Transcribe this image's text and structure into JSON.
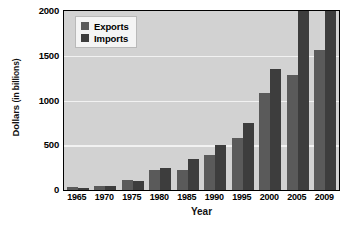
{
  "chart_data": {
    "type": "bar",
    "title": "",
    "xlabel": "Year",
    "ylabel": "Dollars (in billions)",
    "ylabel_main": "Dollars",
    "ylabel_sub": "(in billions)",
    "categories": [
      "1965",
      "1970",
      "1975",
      "1980",
      "1985",
      "1990",
      "1995",
      "2000",
      "2005",
      "2009"
    ],
    "series": [
      {
        "name": "Exports",
        "color": "#5a5a5a",
        "values": [
          30,
          45,
          110,
          225,
          220,
          395,
          585,
          1080,
          1290,
          1560
        ]
      },
      {
        "name": "Imports",
        "color": "#3d3d3d",
        "values": [
          25,
          40,
          100,
          250,
          345,
          500,
          745,
          1350,
          1995,
          1995
        ]
      }
    ],
    "ylim": [
      0,
      2000
    ],
    "yticks": [
      0,
      500,
      1000,
      1500,
      2000
    ],
    "ytick_labels": [
      "0",
      "500",
      "1000",
      "1500",
      "2000"
    ],
    "grid": true,
    "grid_color": "#f2f2f2",
    "plot_background": "#d2d2d2",
    "legend_position": "top-left-inside",
    "legend": [
      "Exports",
      "Imports"
    ]
  },
  "legend": {
    "items": [
      {
        "label": "Exports",
        "swatch": "exports-swatch"
      },
      {
        "label": "Imports",
        "swatch": "imports-swatch"
      }
    ]
  },
  "axes": {
    "x_title": "Year",
    "y_title_main": "Dollars",
    "y_title_sub": "(in billions)"
  },
  "source": {
    "caption": ""
  }
}
